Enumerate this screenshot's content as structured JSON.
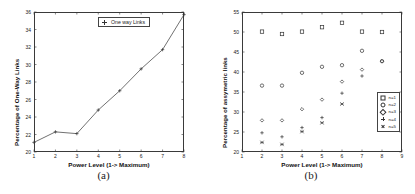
{
  "figure": {
    "panels": [
      {
        "caption": "(a)"
      },
      {
        "caption": "(b)"
      }
    ]
  },
  "chart_data": [
    {
      "type": "line",
      "panel": "a",
      "title": "",
      "xlabel": "Power Level (1-> Maximum)",
      "ylabel": "Percentage of One-Way Links",
      "xlim": [
        1,
        8
      ],
      "ylim": [
        20,
        36
      ],
      "xticks": [
        1,
        2,
        3,
        4,
        5,
        6,
        7,
        8
      ],
      "yticks": [
        20,
        22,
        24,
        26,
        28,
        30,
        32,
        34,
        36
      ],
      "ytick_labels": [
        "20",
        "22",
        "24",
        "26",
        "28",
        "30",
        "32",
        "34",
        "36"
      ],
      "xtick_labels": [
        "1",
        "2",
        "3",
        "4",
        "5",
        "6",
        "7",
        "8"
      ],
      "grid": false,
      "legend_position": "top-right",
      "marker": "plus",
      "series": [
        {
          "name": "One way Links",
          "x": [
            1,
            2,
            3,
            4,
            5,
            6,
            7,
            8
          ],
          "values": [
            21.1,
            22.3,
            22.1,
            24.8,
            27.0,
            29.5,
            31.7,
            35.7
          ]
        }
      ]
    },
    {
      "type": "scatter",
      "panel": "b",
      "title": "",
      "xlabel": "Power Level (1-> Maximum)",
      "ylabel": "Percentage of assymetric links",
      "xlim": [
        1,
        9
      ],
      "ylim": [
        20,
        55
      ],
      "xticks": [
        1,
        2,
        3,
        4,
        5,
        6,
        7,
        8,
        9
      ],
      "yticks": [
        20,
        25,
        30,
        35,
        40,
        45,
        50,
        55
      ],
      "ytick_labels": [
        "20",
        "25",
        "30",
        "35",
        "40",
        "45",
        "50",
        "55"
      ],
      "xtick_labels": [
        "1",
        "2",
        "3",
        "4",
        "5",
        "6",
        "7",
        "8",
        "9"
      ],
      "grid": false,
      "legend_position": "right",
      "legend_entries": [
        {
          "label": "n=1",
          "marker": "square"
        },
        {
          "label": "n=2",
          "marker": "circle"
        },
        {
          "label": "n=3",
          "marker": "diamond"
        },
        {
          "label": "n=4",
          "marker": "plus"
        },
        {
          "label": "n=5",
          "marker": "star"
        }
      ],
      "series": [
        {
          "name": "n=1",
          "marker": "square",
          "x": [
            2,
            3,
            4,
            5,
            6,
            7,
            8
          ],
          "values": [
            50.1,
            49.5,
            50.1,
            51.2,
            52.3,
            50.1,
            50.0
          ]
        },
        {
          "name": "n=2",
          "marker": "circle",
          "x": [
            2,
            3,
            4,
            5,
            6,
            7,
            8
          ],
          "values": [
            36.6,
            36.6,
            39.8,
            41.3,
            41.7,
            45.3,
            42.7
          ]
        },
        {
          "name": "n=3",
          "marker": "diamond",
          "x": [
            2,
            3,
            4,
            5,
            6,
            7,
            8
          ],
          "values": [
            27.9,
            27.9,
            30.7,
            33.1,
            37.6,
            40.6,
            42.7
          ]
        },
        {
          "name": "n=4",
          "marker": "plus",
          "x": [
            2,
            3,
            4,
            5,
            6,
            7
          ],
          "values": [
            24.8,
            23.8,
            26.1,
            28.6,
            34.7,
            39.0
          ]
        },
        {
          "name": "n=5",
          "marker": "star",
          "x": [
            2,
            3,
            4,
            5,
            6
          ],
          "values": [
            22.4,
            21.9,
            25.1,
            27.3,
            32.0
          ]
        }
      ]
    }
  ]
}
